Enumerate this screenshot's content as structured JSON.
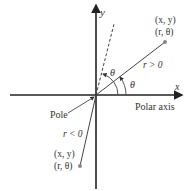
{
  "diagram": {
    "axes": {
      "x_label": "x",
      "y_label": "y"
    },
    "origin_label": "Pole",
    "polar_axis_label": "Polar axis",
    "positive_point": {
      "cartesian": "(x, y)",
      "polar": "(r, θ)",
      "r_label": "r > 0"
    },
    "negative_point": {
      "cartesian": "(x, y)",
      "polar": "(r, θ)",
      "r_label": "r < 0"
    },
    "angle_labels": [
      "θ",
      "θ"
    ],
    "colors": {
      "line": "#333333",
      "text": "#333333",
      "point": "#888888"
    }
  }
}
